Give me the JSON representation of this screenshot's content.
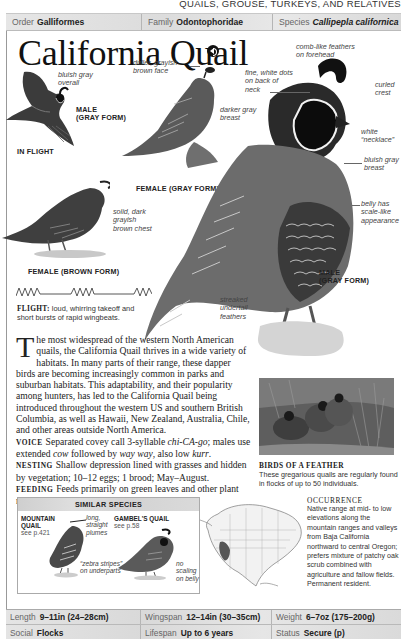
{
  "running_head": "QUAILS, GROUSE, TURKEYS, AND RELATIVES",
  "taxonomy": {
    "order_label": "Order",
    "order_value": "Galliformes",
    "family_label": "Family",
    "family_value": "Odontophoridae",
    "species_label": "Species",
    "species_value": "Callipepla californica"
  },
  "title": "California Quail",
  "audio_icon": "speaker-icon",
  "illustrations": {
    "in_flight": {
      "annotation": "bluish gray overall",
      "caption_1": "MALE",
      "caption_2": "(GRAY FORM)",
      "label": "IN FLIGHT"
    },
    "female_gray": {
      "annotation_face": "duller, grayish brown face",
      "annotation_breast": "darker gray breast",
      "caption": "FEMALE (GRAY FORM)"
    },
    "female_brown": {
      "annotation": "solid, dark grayish brown chest",
      "caption": "FEMALE (BROWN FORM)"
    },
    "male_gray": {
      "annotation_comb": "comb-like feathers on forehead",
      "annotation_dots": "fine, white dots on back of neck",
      "annotation_crest": "curled crest",
      "annotation_necklace": "white “necklace”",
      "annotation_breast": "bluish gray breast",
      "annotation_belly": "belly has scale-like appearance",
      "annotation_undertail": "streaked undertail feathers",
      "caption_1": "MALE",
      "caption_2": "(GRAY FORM)"
    }
  },
  "flight": {
    "label": "FLIGHT:",
    "text": "loud, whirring takeoff and short bursts of rapid wingbeats."
  },
  "description": {
    "dropcap": "T",
    "intro": "he most widespread of the western North American quails, the California Quail thrives in a wide variety of habitats. In many parts of their range, these dapper birds are becoming increasingly common in parks and suburban habitats. This adaptability, and their popularity among hunters, has led to the California Quail being introduced throughout the western US and southern British Columbia, as well as Hawaii, New Zealand, Australia, Chile, and other areas outside North America.",
    "voice_label": "VOICE",
    "voice_text_1": "Separated covey call 3-syllable ",
    "voice_call": "chi-CA-go",
    "voice_text_2": "; males use extended ",
    "voice_cow": "cow",
    "voice_text_3": " followed by ",
    "voice_way": "way way",
    "voice_text_4": ", also low ",
    "voice_kurr": "kurr",
    "voice_text_5": ".",
    "nesting_label": "NESTING",
    "nesting_text": "Shallow depression lined with grasses and hidden by vegetation; 10–12 eggs; 1 brood; May–August.",
    "feeding_label": "FEEDING",
    "feeding_text": "Feeds primarily on green leaves and other plant matter; takes insects when available."
  },
  "photo": {
    "caption_title": "BIRDS OF A FEATHER",
    "caption_text": "These gregarious quails are regularly found in flocks of up to 50 individuals."
  },
  "similar_species": {
    "heading": "SIMILAR SPECIES",
    "species": [
      {
        "name_1": "MOUNTAIN",
        "name_2": "QUAIL",
        "ref": "see p.421",
        "annotation_plumes": "long, straight plumes",
        "annotation_stripes": "“zebra stripes” on underparts"
      },
      {
        "name": "GAMBEL'S QUAIL",
        "ref": "see p.58",
        "annotation_belly": "no scaling on belly"
      }
    ]
  },
  "occurrence": {
    "title": "OCCURRENCE",
    "text": "Native range at mid- to low elevations along the mountain ranges and valleys from Baja California northward to central Oregon; prefers mixture of patchy oak scrub combined with agriculture and fallow fields. Permanent resident."
  },
  "stats": {
    "length_label": "Length",
    "length_value": "9–11in (24–28cm)",
    "wingspan_label": "Wingspan",
    "wingspan_value": "12–14in (30–35cm)",
    "weight_label": "Weight",
    "weight_value": "6–7oz (175–200g)",
    "social_label": "Social",
    "social_value": "Flocks",
    "lifespan_label": "Lifespan",
    "lifespan_value": "Up to 6 years",
    "status_label": "Status",
    "status_value": "Secure (p)"
  },
  "colors": {
    "header_bar": "#dedede",
    "text": "#222222",
    "annotation": "#444444",
    "range_map_fill": "#555555"
  }
}
